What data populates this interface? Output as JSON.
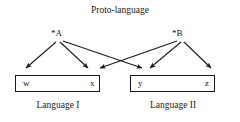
{
  "diagram": {
    "title": "Proto-language",
    "type": "linguistic-descent-diagram",
    "stroke_color": "#1a1a1a",
    "background_color": "#ffffff",
    "proto_nodes": [
      {
        "id": "A",
        "label": "*A",
        "x": 58,
        "y": 37
      },
      {
        "id": "B",
        "label": "*B",
        "x": 179,
        "y": 37
      }
    ],
    "languages": [
      {
        "id": "language-1",
        "caption": "Language I",
        "reflexes": [
          {
            "id": "w",
            "label": "w"
          },
          {
            "id": "x",
            "label": "x"
          }
        ]
      },
      {
        "id": "language-2",
        "caption": "Language II",
        "reflexes": [
          {
            "id": "y",
            "label": "y"
          },
          {
            "id": "z",
            "label": "z"
          }
        ]
      }
    ],
    "arrows": [
      {
        "id": "arrow-a-to-w",
        "from": "A",
        "to": "w",
        "x1": 56,
        "y1": 42,
        "x2": 26,
        "y2": 69
      },
      {
        "id": "arrow-a-to-x",
        "from": "A",
        "to": "x",
        "x1": 60,
        "y1": 42,
        "x2": 88,
        "y2": 69
      },
      {
        "id": "arrow-a-to-y",
        "from": "A",
        "to": "y",
        "x1": 63,
        "y1": 41,
        "x2": 142,
        "y2": 69
      },
      {
        "id": "arrow-b-to-x",
        "from": "B",
        "to": "x",
        "x1": 177,
        "y1": 41,
        "x2": 99,
        "y2": 69
      },
      {
        "id": "arrow-b-to-y",
        "from": "B",
        "to": "y",
        "x1": 181,
        "y1": 42,
        "x2": 150,
        "y2": 69
      },
      {
        "id": "arrow-b-to-z",
        "from": "B",
        "to": "z",
        "x1": 184,
        "y1": 42,
        "x2": 211,
        "y2": 69
      }
    ]
  }
}
